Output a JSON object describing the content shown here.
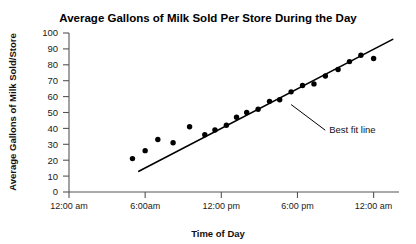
{
  "chart_data": {
    "type": "scatter",
    "title": "Average Gallons of Milk Sold Per Store During the Day",
    "xlabel": "Time of Day",
    "ylabel": "Average Gallons of Milk Sold/Store",
    "xlim": [
      0,
      26
    ],
    "ylim": [
      0,
      100
    ],
    "grid": false,
    "legend": null,
    "x_tick_values": [
      0,
      6,
      12,
      18,
      24
    ],
    "x_tick_labels": [
      "12:00 am",
      "6:00am",
      "12:00 pm",
      "6:00 pm",
      "12:00 am"
    ],
    "y_tick_values": [
      0,
      10,
      20,
      30,
      40,
      50,
      60,
      70,
      80,
      90,
      100
    ],
    "y_tick_labels": [
      "0",
      "10",
      "20",
      "30",
      "40",
      "50",
      "60",
      "70",
      "80",
      "90",
      "100"
    ],
    "series": [
      {
        "name": "Average gallons sold",
        "marker": "filled-circle",
        "color": "#000000",
        "points": [
          {
            "x": 5.0,
            "y": 21
          },
          {
            "x": 6.0,
            "y": 26
          },
          {
            "x": 7.0,
            "y": 33
          },
          {
            "x": 8.2,
            "y": 31
          },
          {
            "x": 9.5,
            "y": 41
          },
          {
            "x": 10.7,
            "y": 36
          },
          {
            "x": 11.5,
            "y": 39
          },
          {
            "x": 12.4,
            "y": 42
          },
          {
            "x": 13.2,
            "y": 47
          },
          {
            "x": 14.0,
            "y": 50
          },
          {
            "x": 14.9,
            "y": 52
          },
          {
            "x": 15.8,
            "y": 57
          },
          {
            "x": 16.6,
            "y": 58
          },
          {
            "x": 17.5,
            "y": 63
          },
          {
            "x": 18.4,
            "y": 67
          },
          {
            "x": 19.3,
            "y": 68
          },
          {
            "x": 20.2,
            "y": 73
          },
          {
            "x": 21.2,
            "y": 77
          },
          {
            "x": 22.1,
            "y": 82
          },
          {
            "x": 23.0,
            "y": 86
          },
          {
            "x": 24.0,
            "y": 84
          }
        ]
      }
    ],
    "trendline": {
      "label": "Best fit line",
      "x_start": 5.5,
      "y_start": 13,
      "x_end": 25.5,
      "y_end": 96
    },
    "annotation": {
      "text": "Best fit line",
      "anchor_x": 17.5,
      "anchor_y": 55,
      "text_x": 20.5,
      "text_y": 37
    }
  }
}
